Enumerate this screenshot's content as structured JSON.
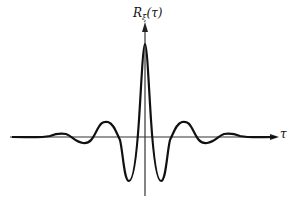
{
  "figure": {
    "y_axis_label_main": "R",
    "y_axis_label_sub": "ξ",
    "y_axis_label_arg": "(τ)",
    "x_axis_label": "τ",
    "colors": {
      "curve": "#111111",
      "axes": "#333333",
      "background": "#ffffff"
    }
  }
}
